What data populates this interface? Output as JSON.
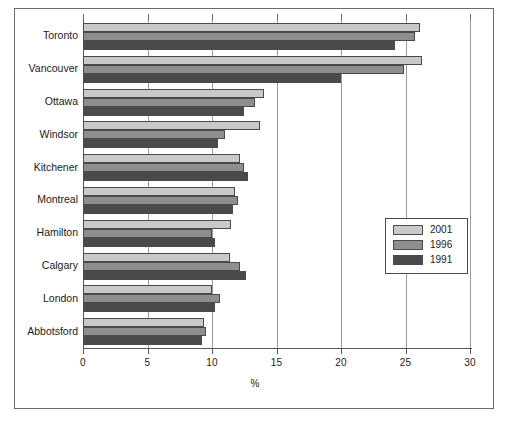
{
  "chart_data": {
    "type": "bar",
    "orientation": "horizontal",
    "title": "",
    "xlabel": "%",
    "ylabel": "",
    "xlim": [
      0,
      30
    ],
    "xticks": [
      0,
      5,
      10,
      15,
      20,
      25,
      30
    ],
    "xtick_labels": [
      "0",
      "5",
      "10",
      "15",
      "20",
      "25",
      "30"
    ],
    "grid": true,
    "grid_axis": "x",
    "legend_position": "center-right",
    "categories": [
      "Toronto",
      "Vancouver",
      "Ottawa",
      "Windsor",
      "Kitchener",
      "Montreal",
      "Hamilton",
      "Calgary",
      "London",
      "Abbotsford"
    ],
    "series": [
      {
        "name": "2001",
        "color": "#c9c9c9",
        "values": [
          26.1,
          26.3,
          14.0,
          13.7,
          12.2,
          11.8,
          11.5,
          11.4,
          10.0,
          9.4
        ]
      },
      {
        "name": "1996",
        "color": "#8e8e8e",
        "values": [
          25.7,
          24.9,
          13.3,
          11.0,
          12.5,
          12.0,
          10.0,
          12.2,
          10.6,
          9.5
        ]
      },
      {
        "name": "1991",
        "color": "#4a4a4a",
        "values": [
          24.2,
          20.0,
          12.5,
          10.5,
          12.8,
          11.6,
          10.2,
          12.6,
          10.2,
          9.2
        ]
      }
    ]
  },
  "legend": {
    "entries": [
      {
        "label": "2001",
        "color": "#c9c9c9"
      },
      {
        "label": "1996",
        "color": "#8e8e8e"
      },
      {
        "label": "1991",
        "color": "#4a4a4a"
      }
    ]
  },
  "axis": {
    "x_title": "%"
  },
  "bottom_caption": ""
}
